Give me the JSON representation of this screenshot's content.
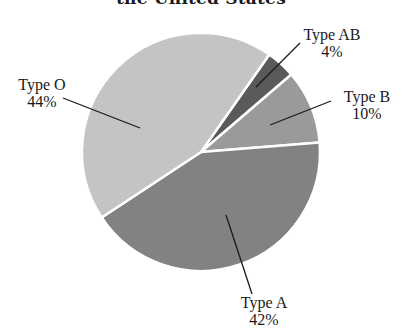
{
  "title": "the United States",
  "chart_data": {
    "type": "pie",
    "title": "the United States",
    "categories": [
      "Type O",
      "Type A",
      "Type B",
      "Type AB"
    ],
    "values": [
      44,
      42,
      10,
      4
    ],
    "unit": "%",
    "colors": {
      "Type O": "#c4c4c4",
      "Type A": "#828282",
      "Type B": "#9a9a9a",
      "Type AB": "#5a5a5a"
    },
    "slice_border": "#ffffff",
    "legend": "none (direct labels with leader lines)"
  },
  "labels": [
    {
      "name": "Type O",
      "pct": "44%"
    },
    {
      "name": "Type AB",
      "pct": "4%"
    },
    {
      "name": "Type B",
      "pct": "10%"
    },
    {
      "name": "Type A",
      "pct": "42%"
    }
  ]
}
